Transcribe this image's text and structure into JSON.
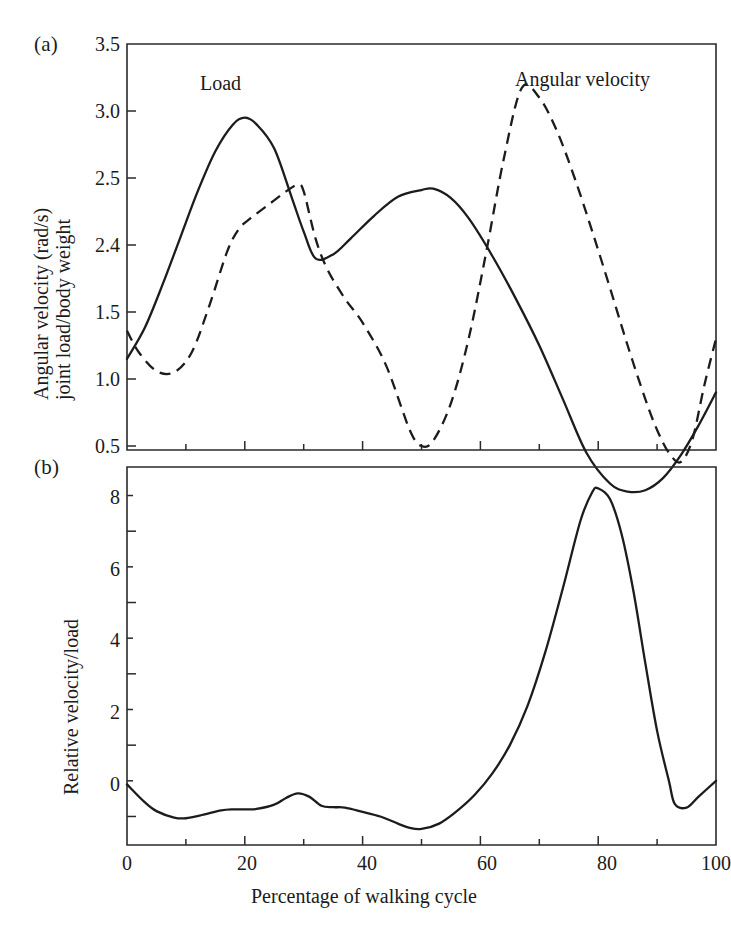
{
  "figure": {
    "panel_a_letter": "(a)",
    "panel_b_letter": "(b)",
    "xaxis_title": "Percentage of walking cycle"
  },
  "panel_a": {
    "ylabel_line1": "Angular velocity (rad/s)",
    "ylabel_line2": "joint load/body weight",
    "ytick_labels": [
      "3.5",
      "3.0",
      "2.5",
      "2.4",
      "1.5",
      "1.0",
      "0.5"
    ],
    "series_labels": {
      "load": "Load",
      "angular_velocity": "Angular velocity"
    }
  },
  "panel_b": {
    "ylabel": "Relative velocity/load",
    "ytick_labels": [
      "8",
      "6",
      "4",
      "2",
      "0"
    ]
  },
  "xaxis": {
    "tick_labels": [
      "0",
      "20",
      "40",
      "60",
      "80",
      "100"
    ]
  },
  "chart_data": [
    {
      "type": "line",
      "panel": "(a)",
      "title": "",
      "xlabel": "Percentage of walking cycle",
      "ylabel": "Angular velocity (rad/s) joint load/body weight",
      "xlim": [
        0,
        100
      ],
      "ylim": [
        0,
        3.5
      ],
      "xticks": [
        0,
        20,
        40,
        60,
        80,
        100
      ],
      "xminor_ticks": [
        10,
        30,
        50,
        70,
        90
      ],
      "ytick_positions": [
        3.5,
        3.0,
        2.5,
        2.0,
        1.5,
        1.0,
        0.5
      ],
      "ytick_labels": [
        "3.5",
        "3.0",
        "2.5",
        "2.4",
        "1.5",
        "1.0",
        "0.5"
      ],
      "ytick_label_note": "The 4th tick is printed as 2.4 in the original figure though it falls at the 2.0 position",
      "grid": false,
      "legend": "inline annotations",
      "series": [
        {
          "name": "Load",
          "style": "solid",
          "annotation": "Load",
          "annotation_x": 15,
          "annotation_y": 3.22,
          "x": [
            0,
            3,
            6,
            9,
            12,
            15,
            18,
            20,
            22,
            25,
            28,
            30,
            32,
            35,
            38,
            42,
            46,
            50,
            52,
            55,
            58,
            62,
            66,
            70,
            74,
            78,
            82,
            85,
            88,
            91,
            94,
            97,
            100
          ],
          "y": [
            1.15,
            1.38,
            1.7,
            2.05,
            2.4,
            2.7,
            2.9,
            2.95,
            2.9,
            2.72,
            2.35,
            2.1,
            1.9,
            1.93,
            2.05,
            2.22,
            2.36,
            2.41,
            2.42,
            2.35,
            2.2,
            1.92,
            1.6,
            1.25,
            0.85,
            0.45,
            0.22,
            0.16,
            0.17,
            0.26,
            0.43,
            0.65,
            0.9
          ]
        },
        {
          "name": "Angular velocity",
          "style": "dashed",
          "annotation": "Angular velocity",
          "annotation_x": 72,
          "annotation_y": 3.27,
          "x": [
            0,
            2,
            5,
            8,
            11,
            14,
            17,
            19,
            21,
            24,
            27,
            29,
            30,
            32,
            34,
            37,
            40,
            44,
            48,
            50,
            52,
            55,
            58,
            61,
            64,
            67,
            70,
            73,
            76,
            79,
            82,
            85,
            88,
            90,
            92,
            94,
            96,
            98,
            100
          ],
          "y": [
            1.36,
            1.2,
            1.06,
            1.05,
            1.2,
            1.55,
            1.95,
            2.12,
            2.2,
            2.3,
            2.4,
            2.45,
            2.4,
            2.05,
            1.82,
            1.6,
            1.42,
            1.1,
            0.62,
            0.5,
            0.54,
            0.82,
            1.3,
            1.95,
            2.65,
            3.17,
            3.1,
            2.85,
            2.5,
            2.1,
            1.68,
            1.25,
            0.85,
            0.62,
            0.45,
            0.38,
            0.55,
            0.95,
            1.3
          ]
        }
      ]
    },
    {
      "type": "line",
      "panel": "(b)",
      "title": "",
      "xlabel": "Percentage of walking cycle",
      "ylabel": "Relative velocity/load",
      "xlim": [
        0,
        100
      ],
      "ylim": [
        -0.8,
        9.8
      ],
      "xticks": [
        0,
        20,
        40,
        60,
        80,
        100
      ],
      "xminor_ticks": [
        10,
        30,
        50,
        70,
        90
      ],
      "yticks": [
        0,
        2,
        4,
        6,
        8
      ],
      "yminor_ticks": [
        1,
        3,
        5,
        7,
        9
      ],
      "grid": false,
      "series": [
        {
          "name": "Relative velocity/load",
          "style": "solid",
          "x": [
            0,
            3,
            5,
            8,
            10,
            13,
            16,
            18,
            20,
            22,
            25,
            27,
            29,
            31,
            33,
            35,
            37,
            40,
            43,
            46,
            48,
            50,
            53,
            56,
            59,
            62,
            65,
            68,
            71,
            74,
            77,
            79,
            80,
            82,
            84,
            86,
            88,
            90,
            92,
            93,
            95,
            97,
            100
          ],
          "y": [
            0.9,
            0.4,
            0.15,
            -0.03,
            -0.05,
            0.05,
            0.17,
            0.2,
            0.2,
            0.21,
            0.33,
            0.52,
            0.65,
            0.55,
            0.3,
            0.26,
            0.25,
            0.13,
            0.0,
            -0.2,
            -0.32,
            -0.35,
            -0.2,
            0.15,
            0.6,
            1.2,
            2.0,
            3.1,
            4.6,
            6.4,
            8.3,
            9.1,
            9.2,
            8.9,
            7.9,
            6.3,
            4.3,
            2.4,
            1.0,
            0.35,
            0.25,
            0.55,
            1.0
          ]
        }
      ]
    }
  ]
}
